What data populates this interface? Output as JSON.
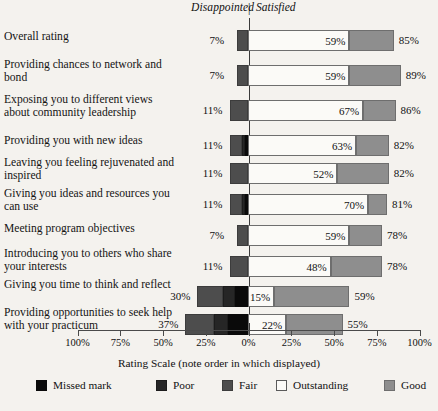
{
  "header": {
    "left_label": "Disappointed",
    "divider": "|",
    "right_label": "Satisfied"
  },
  "axis": {
    "title": "Rating Scale (note order in which displayed)",
    "tick_labels": [
      "100%",
      "75%",
      "50%",
      "25%",
      "0%",
      "25%",
      "50%",
      "75%",
      "100%"
    ],
    "tick_values": [
      -100,
      -75,
      -50,
      -25,
      0,
      25,
      50,
      75,
      100
    ]
  },
  "legend": {
    "items": [
      {
        "label": "Missed mark",
        "color": "#0a0a0a",
        "key": "missed"
      },
      {
        "label": "Poor",
        "color": "#262626",
        "key": "poor"
      },
      {
        "label": "Fair",
        "color": "#4d4d4d",
        "key": "fair"
      },
      {
        "label": "Outstanding",
        "color": "#fbfaf7",
        "key": "outstanding"
      },
      {
        "label": "Good",
        "color": "#8e8e8e",
        "key": "good"
      }
    ]
  },
  "chart_data": {
    "type": "bar",
    "subtype": "diverging-stacked-bar",
    "title": "",
    "xlabel": "Rating Scale (note order in which displayed)",
    "ylabel": "",
    "xlim": [
      -100,
      100
    ],
    "grid": false,
    "legend_position": "bottom",
    "legend_order": [
      "Missed mark",
      "Poor",
      "Fair",
      "Outstanding",
      "Good"
    ],
    "negative_side_label": "Disappointed",
    "positive_side_label": "Satisfied",
    "categories": [
      "Overall rating",
      "Providing chances to network and bond",
      "Exposing you to different views about community leadership",
      "Providing you with new ideas",
      "Leaving you feeling rejuvenated and inspired",
      "Giving you ideas and resources you can use",
      "Meeting program objectives",
      "Introducing you to others who share your interests",
      "Giving you time to think and reflect",
      "Providing opportunities to seek help with your practicum"
    ],
    "series": [
      {
        "name": "Missed mark",
        "values": [
          0,
          0,
          0,
          2,
          0,
          2,
          0,
          0,
          8,
          12
        ]
      },
      {
        "name": "Poor",
        "values": [
          0,
          0,
          0,
          2,
          0,
          2,
          0,
          0,
          7,
          8
        ]
      },
      {
        "name": "Fair",
        "values": [
          7,
          7,
          11,
          7,
          11,
          7,
          7,
          11,
          15,
          17
        ]
      },
      {
        "name": "Outstanding",
        "values": [
          59,
          59,
          67,
          63,
          52,
          70,
          59,
          48,
          15,
          22
        ]
      },
      {
        "name": "Good",
        "values": [
          26,
          30,
          19,
          19,
          30,
          11,
          19,
          30,
          44,
          33
        ]
      }
    ],
    "rows": [
      {
        "label": "Overall rating",
        "left_total_label": "7%",
        "inner_label": "59%",
        "right_total_label": "85%",
        "negative": 7,
        "outstanding": 59,
        "good": 26
      },
      {
        "label": "Providing chances to network and bond",
        "left_total_label": "7%",
        "inner_label": "59%",
        "right_total_label": "89%",
        "negative": 7,
        "outstanding": 59,
        "good": 30
      },
      {
        "label": "Exposing you to different views about community leadership",
        "left_total_label": "11%",
        "inner_label": "67%",
        "right_total_label": "86%",
        "negative": 11,
        "outstanding": 67,
        "good": 19
      },
      {
        "label": "Providing you with new ideas",
        "left_total_label": "11%",
        "inner_label": "63%",
        "right_total_label": "82%",
        "negative": 11,
        "outstanding": 63,
        "good": 19
      },
      {
        "label": "Leaving you feeling rejuvenated and inspired",
        "left_total_label": "11%",
        "inner_label": "52%",
        "right_total_label": "82%",
        "negative": 11,
        "outstanding": 52,
        "good": 30
      },
      {
        "label": "Giving you ideas and resources you can use",
        "left_total_label": "11%",
        "inner_label": "70%",
        "right_total_label": "81%",
        "negative": 11,
        "outstanding": 70,
        "good": 11
      },
      {
        "label": "Meeting program objectives",
        "left_total_label": "7%",
        "inner_label": "59%",
        "right_total_label": "78%",
        "negative": 7,
        "outstanding": 59,
        "good": 19
      },
      {
        "label": "Introducing you to others who share your interests",
        "left_total_label": "11%",
        "inner_label": "48%",
        "right_total_label": "78%",
        "negative": 11,
        "outstanding": 48,
        "good": 30
      },
      {
        "label": "Giving you time to think and reflect",
        "left_total_label": "30%",
        "inner_label": "15%",
        "right_total_label": "59%",
        "negative": 30,
        "outstanding": 15,
        "good": 44
      },
      {
        "label": "Providing opportunities to seek help with your practicum",
        "left_total_label": "37%",
        "inner_label": "22%",
        "right_total_label": "55%",
        "negative": 37,
        "outstanding": 22,
        "good": 33
      }
    ]
  }
}
